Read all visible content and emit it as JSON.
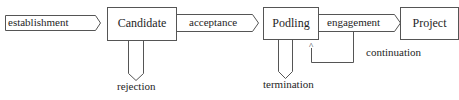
{
  "diagram": {
    "type": "state-lifecycle",
    "stroke_color": "#555555",
    "nodes": [
      {
        "id": "candidate",
        "label": "Candidate"
      },
      {
        "id": "podling",
        "label": "Podling"
      },
      {
        "id": "project",
        "label": "Project"
      }
    ],
    "transitions": [
      {
        "id": "establishment",
        "label": "establishment",
        "from": null,
        "to": "candidate"
      },
      {
        "id": "acceptance",
        "label": "acceptance",
        "from": "candidate",
        "to": "podling"
      },
      {
        "id": "engagement",
        "label": "engagement",
        "from": "podling",
        "to": "project"
      },
      {
        "id": "rejection",
        "label": "rejection",
        "from": "candidate",
        "to": null
      },
      {
        "id": "termination",
        "label": "termination",
        "from": "podling",
        "to": null
      },
      {
        "id": "continuation",
        "label": "continuation",
        "from": "podling",
        "to": "podling",
        "marker": "^"
      }
    ]
  }
}
